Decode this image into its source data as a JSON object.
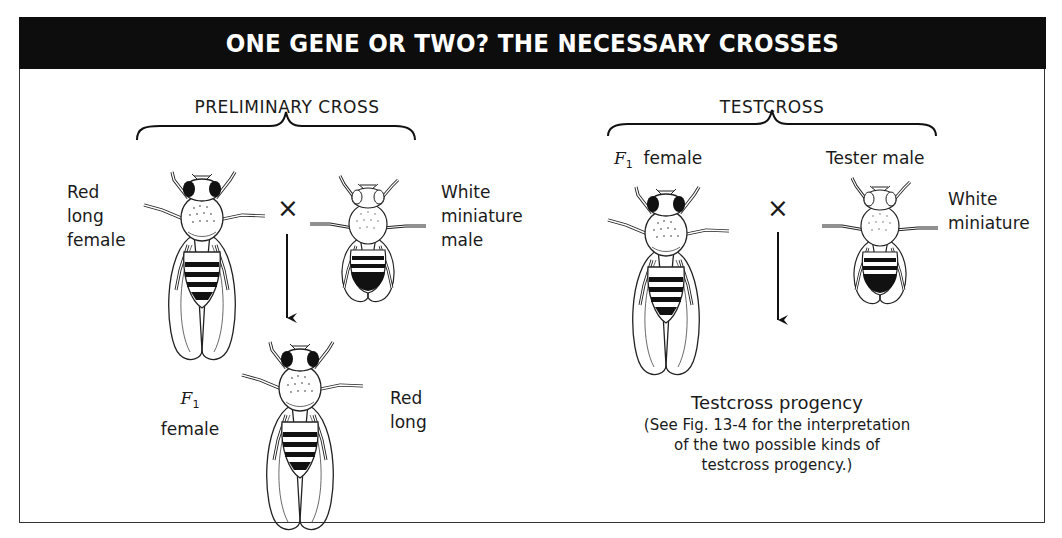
{
  "header": {
    "title": "ONE GENE OR TWO? THE NECESSARY CROSSES",
    "background": "#0d0d0d",
    "text_color": "#ffffff"
  },
  "preliminary_cross": {
    "title": "PRELIMINARY CROSS",
    "female": {
      "lines": [
        "Red",
        "long",
        "female"
      ],
      "eye": "red",
      "wings": "long"
    },
    "male": {
      "lines": [
        "White",
        "miniature",
        "male"
      ],
      "eye": "white",
      "wings": "miniature"
    },
    "cross_symbol": "×",
    "offspring": {
      "label_generation": "F",
      "label_subscript": "1",
      "label_sex": "female",
      "phenotype_lines": [
        "Red",
        "long"
      ]
    }
  },
  "testcross": {
    "title": "TESTCROSS",
    "female": {
      "label_generation": "F",
      "label_subscript": "1",
      "label_sex": "female"
    },
    "male": {
      "label": "Tester male",
      "phenotype_lines": [
        "White",
        "miniature"
      ]
    },
    "cross_symbol": "×",
    "progeny": {
      "title": "Testcross progency",
      "note_lines": [
        "(See Fig. 13-4 for the interpretation",
        "of the two possible kinds of",
        "testcross progency.)"
      ]
    }
  }
}
